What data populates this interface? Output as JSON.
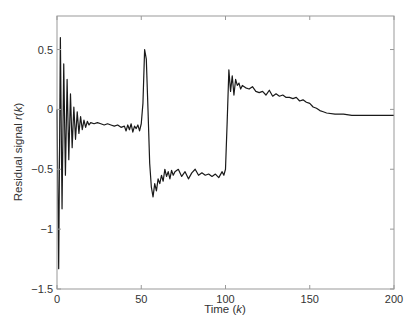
{
  "chart_data": {
    "type": "line",
    "title": "",
    "xlabel": "Time (k)",
    "ylabel": "Residual signal r(k)",
    "xlabel_parts": {
      "prefix": "Time (",
      "var": "k",
      "suffix": ")"
    },
    "ylabel_parts": {
      "prefix": "Residual signal ",
      "var": "r",
      "mid": "(",
      "var2": "k",
      "suffix": ")"
    },
    "xlim": [
      0,
      200
    ],
    "ylim": [
      -1.5,
      0.78
    ],
    "xticks": [
      0,
      50,
      100,
      150,
      200
    ],
    "xtick_labels": [
      "0",
      "50",
      "100",
      "150",
      "200"
    ],
    "yticks": [
      -1.5,
      -1,
      -0.5,
      0,
      0.5
    ],
    "ytick_labels": [
      "-1.5",
      "-1",
      "-0.5",
      "0",
      "0.5"
    ],
    "grid": false,
    "legend": null,
    "line_color": "#1a1a1a",
    "series": [
      {
        "name": "r(k)",
        "x": [
          0,
          1,
          2,
          3,
          4,
          5,
          6,
          7,
          8,
          9,
          10,
          11,
          12,
          13,
          14,
          15,
          16,
          17,
          18,
          19,
          20,
          22,
          24,
          26,
          28,
          30,
          32,
          34,
          36,
          38,
          40,
          41,
          42,
          43,
          44,
          45,
          46,
          47,
          48,
          49,
          50,
          51,
          52,
          53,
          54,
          55,
          56,
          57,
          58,
          59,
          60,
          61,
          62,
          63,
          64,
          65,
          66,
          67,
          68,
          69,
          70,
          72,
          74,
          76,
          78,
          80,
          82,
          84,
          86,
          88,
          90,
          92,
          94,
          96,
          98,
          99,
          100,
          101,
          102,
          103,
          104,
          105,
          106,
          107,
          108,
          109,
          110,
          112,
          114,
          116,
          118,
          120,
          122,
          124,
          126,
          128,
          130,
          132,
          134,
          136,
          138,
          140,
          142,
          144,
          146,
          148,
          150,
          152,
          154,
          156,
          158,
          160,
          165,
          170,
          175,
          180,
          185,
          190,
          195,
          200
        ],
        "values": [
          0.0,
          -1.33,
          0.6,
          -0.83,
          0.38,
          -0.55,
          0.25,
          -0.42,
          0.13,
          -0.32,
          0.02,
          -0.25,
          -0.02,
          -0.2,
          -0.06,
          -0.17,
          -0.09,
          -0.15,
          -0.1,
          -0.13,
          -0.11,
          -0.12,
          -0.11,
          -0.12,
          -0.13,
          -0.12,
          -0.13,
          -0.14,
          -0.13,
          -0.15,
          -0.14,
          -0.18,
          -0.13,
          -0.17,
          -0.12,
          -0.19,
          -0.14,
          -0.16,
          -0.13,
          -0.18,
          -0.12,
          0.05,
          0.5,
          0.42,
          0.0,
          -0.45,
          -0.65,
          -0.73,
          -0.62,
          -0.68,
          -0.58,
          -0.62,
          -0.55,
          -0.6,
          -0.5,
          -0.56,
          -0.52,
          -0.58,
          -0.51,
          -0.55,
          -0.52,
          -0.5,
          -0.56,
          -0.52,
          -0.58,
          -0.53,
          -0.5,
          -0.55,
          -0.53,
          -0.55,
          -0.54,
          -0.56,
          -0.54,
          -0.57,
          -0.52,
          -0.55,
          -0.5,
          -0.1,
          0.33,
          0.15,
          0.28,
          0.12,
          0.25,
          0.2,
          0.22,
          0.17,
          0.2,
          0.18,
          0.17,
          0.19,
          0.15,
          0.14,
          0.15,
          0.12,
          0.16,
          0.11,
          0.13,
          0.11,
          0.12,
          0.1,
          0.1,
          0.09,
          0.1,
          0.07,
          0.08,
          0.06,
          0.05,
          0.02,
          0.01,
          -0.01,
          -0.02,
          -0.03,
          -0.04,
          -0.04,
          -0.05,
          -0.05,
          -0.05,
          -0.05,
          -0.05,
          -0.05
        ]
      }
    ]
  }
}
